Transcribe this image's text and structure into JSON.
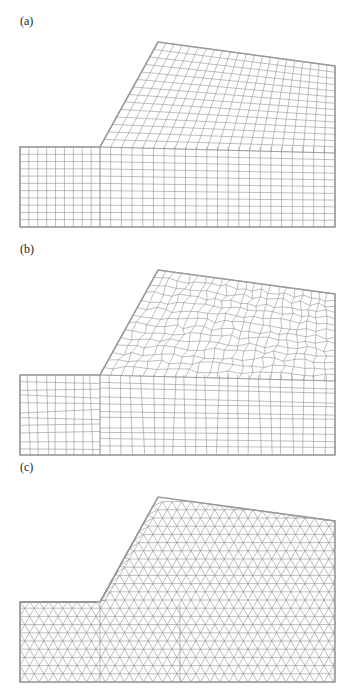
{
  "figure": {
    "panels": [
      {
        "id": "a",
        "label": "(a)",
        "mesh_type": "structured quadrilateral",
        "offset_y": 0,
        "label_top": 14
      },
      {
        "id": "b",
        "label": "(b)",
        "mesh_type": "unstructured quadrilateral",
        "offset_y": 228,
        "label_top": 242
      },
      {
        "id": "c",
        "label": "(c)",
        "mesh_type": "triangular",
        "offset_y": 455,
        "label_top": 460
      }
    ],
    "geometry": {
      "description": "Slope domain: flat toe on left, inclined slope face, sloping crest, vertical right boundary",
      "vertices": [
        [
          20,
          227
        ],
        [
          20,
          147
        ],
        [
          100,
          147
        ],
        [
          158,
          42
        ],
        [
          335,
          66
        ],
        [
          335,
          227
        ]
      ],
      "mesh_color": "#8a8a8a",
      "outline_color": "#9a9a9a"
    }
  }
}
